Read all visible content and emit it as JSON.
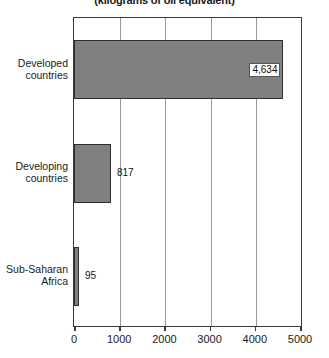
{
  "chart_data": {
    "type": "bar",
    "orientation": "horizontal",
    "title": "(kilograms of oil equivalent)",
    "subtitle": "",
    "xlabel": "",
    "ylabel": "",
    "categories": [
      "Developed countries",
      "Developing countries",
      "Sub-Saharan Africa"
    ],
    "values": [
      4634,
      817,
      95
    ],
    "value_labels": [
      "4,634",
      "817",
      "95"
    ],
    "xlim": [
      0,
      5000
    ],
    "xticks": [
      0,
      1000,
      2000,
      3000,
      4000,
      5000
    ],
    "xtick_labels": [
      "0",
      "1000",
      "2000",
      "3000",
      "4000",
      "5000"
    ],
    "grid": true,
    "grid_axis": "x",
    "legend": false,
    "bar_color": "#808080",
    "bar_border_color": "#2e2e2e",
    "axis_color": "#3a3a3a",
    "grid_color": "#9a9a9a",
    "label_placement": [
      "inside-right",
      "outside-right",
      "outside-right"
    ]
  },
  "bars": [
    {
      "category_line1": "Developed",
      "category_line2": "countries",
      "value_label": "4,634",
      "value": 4634
    },
    {
      "category_line1": "Developing",
      "category_line2": "countries",
      "value_label": "817",
      "value": 817
    },
    {
      "category_line1": "Sub-Saharan",
      "category_line2": "Africa",
      "value_label": "95",
      "value": 95
    }
  ],
  "axis": {
    "ticks": [
      "0",
      "1000",
      "2000",
      "3000",
      "4000",
      "5000"
    ]
  }
}
